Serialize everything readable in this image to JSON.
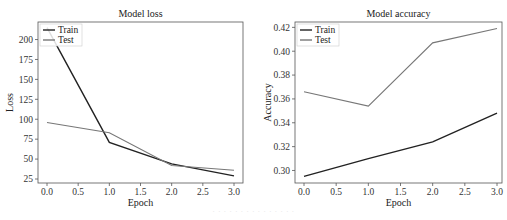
{
  "chart_data": [
    {
      "type": "line",
      "title": "Model loss",
      "xlabel": "Epoch",
      "ylabel": "Loss",
      "x": [
        0,
        1,
        2,
        3
      ],
      "xticks": [
        "0.0",
        "0.5",
        "1.0",
        "1.5",
        "2.0",
        "2.5",
        "3.0"
      ],
      "yticks": [
        "25",
        "50",
        "75",
        "100",
        "125",
        "150",
        "175",
        "200"
      ],
      "ylim": [
        20,
        222
      ],
      "grid": false,
      "legend_position": "upper left",
      "series": [
        {
          "name": "Train",
          "color": "#222222",
          "values": [
            215,
            71,
            44,
            29
          ]
        },
        {
          "name": "Test",
          "color": "#777777",
          "values": [
            96,
            83,
            42,
            36
          ]
        }
      ]
    },
    {
      "type": "line",
      "title": "Model accuracy",
      "xlabel": "Epoch",
      "ylabel": "Accuracy",
      "x": [
        0,
        1,
        2,
        3
      ],
      "xticks": [
        "0.0",
        "0.5",
        "1.0",
        "1.5",
        "2.0",
        "2.5",
        "3.0"
      ],
      "yticks": [
        "0.30",
        "0.32",
        "0.34",
        "0.36",
        "0.38",
        "0.40",
        "0.42"
      ],
      "ylim": [
        0.2895,
        0.4245
      ],
      "grid": false,
      "legend_position": "upper left",
      "series": [
        {
          "name": "Train",
          "color": "#222222",
          "values": [
            0.295,
            0.31,
            0.324,
            0.348
          ]
        },
        {
          "name": "Test",
          "color": "#777777",
          "values": [
            0.366,
            0.354,
            0.407,
            0.419
          ]
        }
      ]
    }
  ],
  "caption": "· · · · · · · · · · · · · · ·"
}
